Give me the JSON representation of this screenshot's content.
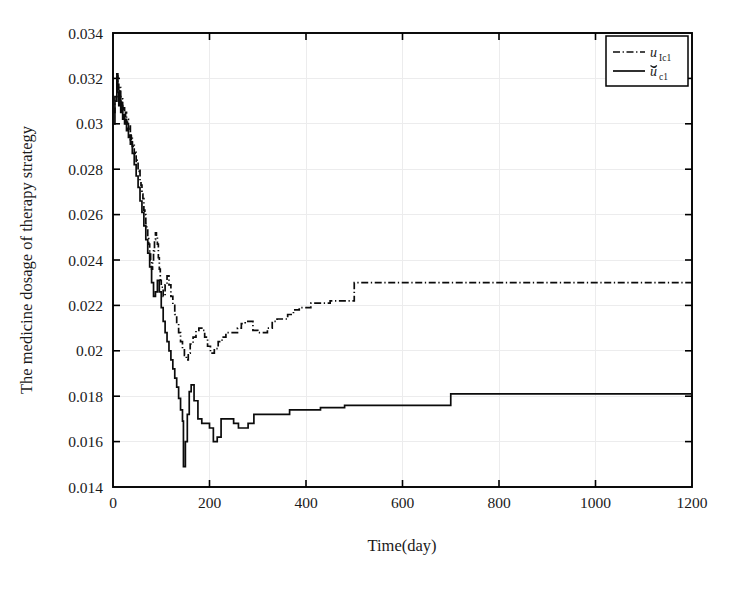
{
  "figure": {
    "background": "#ffffff",
    "width": 730,
    "height": 590
  },
  "chart_data": {
    "type": "line",
    "title": "",
    "xlabel": "Time(day)",
    "ylabel": "The medicine dosage of therapy strategy",
    "xlim": [
      0,
      1200
    ],
    "ylim": [
      0.014,
      0.034
    ],
    "xticks": [
      0,
      200,
      400,
      600,
      800,
      1000,
      1200
    ],
    "xtick_labels": [
      "0",
      "200",
      "400",
      "600",
      "800",
      "1000",
      "1200"
    ],
    "yticks": [
      0.014,
      0.016,
      0.018,
      0.02,
      0.022,
      0.024,
      0.026,
      0.028,
      0.03,
      0.032,
      0.034
    ],
    "ytick_labels": [
      "0.014",
      "0.016",
      "0.018",
      "0.02",
      "0.022",
      "0.024",
      "0.026",
      "0.028",
      "0.03",
      "0.032",
      "0.034"
    ],
    "grid": true,
    "grid_color": "#ececed",
    "legend_position": "top-right",
    "line_color": "#0b0b0b",
    "series": [
      {
        "name": "u_Ic1",
        "label_base": "u",
        "label_sub": "Ic1",
        "style": "dash-dot",
        "accent": "none",
        "x": [
          0,
          4,
          8,
          10,
          12,
          14,
          16,
          18,
          20,
          22,
          24,
          26,
          28,
          30,
          32,
          34,
          36,
          38,
          40,
          42,
          44,
          46,
          48,
          50,
          52,
          54,
          56,
          58,
          60,
          62,
          64,
          66,
          68,
          70,
          72,
          74,
          76,
          78,
          80,
          82,
          84,
          86,
          88,
          90,
          92,
          94,
          96,
          98,
          100,
          104,
          108,
          112,
          116,
          120,
          124,
          128,
          132,
          136,
          140,
          144,
          148,
          152,
          156,
          160,
          166,
          172,
          178,
          184,
          190,
          196,
          202,
          210,
          218,
          226,
          234,
          242,
          250,
          258,
          266,
          274,
          282,
          290,
          300,
          310,
          320,
          330,
          340,
          350,
          362,
          374,
          386,
          398,
          410,
          430,
          450,
          470,
          490,
          500,
          520,
          560,
          620,
          700,
          800,
          900,
          1000,
          1100,
          1200
        ],
        "y": [
          0.0305,
          0.0312,
          0.0322,
          0.0318,
          0.0312,
          0.0316,
          0.0308,
          0.0311,
          0.0305,
          0.0307,
          0.0303,
          0.0305,
          0.03,
          0.0302,
          0.0297,
          0.0299,
          0.0293,
          0.0295,
          0.029,
          0.0291,
          0.0287,
          0.0288,
          0.0283,
          0.0284,
          0.0279,
          0.028,
          0.0275,
          0.0273,
          0.0269,
          0.0267,
          0.0262,
          0.026,
          0.0256,
          0.0254,
          0.025,
          0.0247,
          0.0243,
          0.024,
          0.0236,
          0.0239,
          0.0244,
          0.0249,
          0.0252,
          0.0251,
          0.0247,
          0.0241,
          0.0236,
          0.0231,
          0.0228,
          0.0224,
          0.0229,
          0.0233,
          0.0229,
          0.0224,
          0.022,
          0.0216,
          0.0212,
          0.0208,
          0.0204,
          0.0201,
          0.0198,
          0.0196,
          0.0199,
          0.0203,
          0.0206,
          0.0209,
          0.021,
          0.0209,
          0.0206,
          0.0202,
          0.0199,
          0.0201,
          0.0204,
          0.0206,
          0.0208,
          0.0208,
          0.0208,
          0.021,
          0.0212,
          0.0213,
          0.0213,
          0.0209,
          0.0208,
          0.0208,
          0.021,
          0.0213,
          0.0214,
          0.0214,
          0.0216,
          0.0218,
          0.0219,
          0.0219,
          0.0221,
          0.0221,
          0.0222,
          0.0222,
          0.0222,
          0.023,
          0.023,
          0.023,
          0.023,
          0.023,
          0.023,
          0.023,
          0.023,
          0.023,
          0.023
        ]
      },
      {
        "name": "u_c1_breve",
        "label_base": "ŭ",
        "label_sub": "c1",
        "style": "solid",
        "accent": "breve",
        "x": [
          0,
          4,
          8,
          10,
          12,
          14,
          16,
          18,
          20,
          22,
          24,
          26,
          28,
          30,
          32,
          34,
          36,
          38,
          40,
          44,
          48,
          52,
          56,
          60,
          64,
          68,
          72,
          76,
          80,
          84,
          88,
          92,
          96,
          100,
          104,
          108,
          112,
          116,
          120,
          124,
          128,
          132,
          136,
          140,
          144,
          146,
          150,
          154,
          158,
          162,
          168,
          176,
          184,
          192,
          200,
          208,
          216,
          224,
          232,
          240,
          250,
          260,
          270,
          280,
          292,
          304,
          316,
          328,
          340,
          352,
          366,
          380,
          394,
          410,
          430,
          450,
          470,
          480,
          520,
          560,
          620,
          680,
          700,
          800,
          900,
          1000,
          1100,
          1200
        ],
        "y": [
          0.03,
          0.031,
          0.0321,
          0.0314,
          0.0308,
          0.0312,
          0.0305,
          0.0308,
          0.0302,
          0.0304,
          0.03,
          0.0302,
          0.0297,
          0.0298,
          0.0294,
          0.0295,
          0.0291,
          0.0292,
          0.0287,
          0.0282,
          0.0277,
          0.0272,
          0.0266,
          0.0261,
          0.0255,
          0.0249,
          0.0243,
          0.0237,
          0.023,
          0.0224,
          0.0226,
          0.0231,
          0.0226,
          0.0219,
          0.0213,
          0.0208,
          0.0204,
          0.02,
          0.0196,
          0.0192,
          0.0188,
          0.0184,
          0.0179,
          0.0174,
          0.0169,
          0.0149,
          0.016,
          0.0172,
          0.0182,
          0.0185,
          0.0178,
          0.017,
          0.0168,
          0.0168,
          0.0166,
          0.016,
          0.0162,
          0.017,
          0.017,
          0.017,
          0.0168,
          0.0166,
          0.0166,
          0.0168,
          0.0172,
          0.0172,
          0.0172,
          0.0172,
          0.0172,
          0.0172,
          0.0174,
          0.0174,
          0.0174,
          0.0174,
          0.0175,
          0.0175,
          0.0175,
          0.0176,
          0.0176,
          0.0176,
          0.0176,
          0.0176,
          0.0181,
          0.0181,
          0.0181,
          0.0181,
          0.0181,
          0.0181
        ]
      }
    ]
  }
}
